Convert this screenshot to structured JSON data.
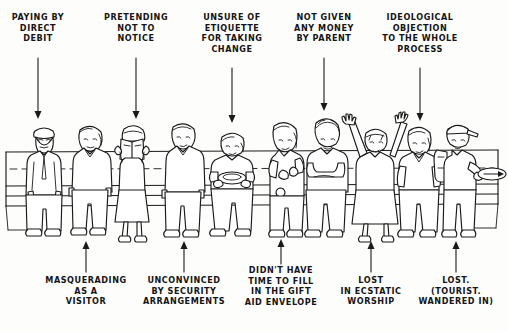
{
  "scene": {
    "title": "Church collection plate cartoon",
    "description": "A row of ten people standing and sitting at a church pew as the collection plate is passed, each annotated with a reason for not giving.",
    "ink_color": "#1a1a1a",
    "paper_color": "#fdfdfc"
  },
  "top_labels": [
    {
      "id": "paying-by-direct-debit",
      "text": "PAYING BY\nDIRECT\nDEBIT",
      "x": 38,
      "label_y": 12,
      "arrow_from": 52,
      "arrow_to": 112
    },
    {
      "id": "pretending-not-to-notice",
      "text": "PRETENDING\nNOT TO\nNOTICE",
      "x": 136,
      "label_y": 12,
      "arrow_from": 52,
      "arrow_to": 112
    },
    {
      "id": "unsure-of-etiquette",
      "text": "UNSURE OF\nETIQUETTE\nFOR TAKING\nCHANGE",
      "x": 232,
      "label_y": 12,
      "arrow_from": 62,
      "arrow_to": 120
    },
    {
      "id": "not-given-any-money",
      "text": "NOT GIVEN\nANY MONEY\nBY PARENT",
      "x": 324,
      "label_y": 12,
      "arrow_from": 52,
      "arrow_to": 110
    },
    {
      "id": "ideological-objection",
      "text": "IDEOLOGICAL\nOBJECTION\nTO THE WHOLE\nPROCESS",
      "x": 420,
      "label_y": 12,
      "arrow_from": 62,
      "arrow_to": 120
    }
  ],
  "bottom_labels": [
    {
      "id": "masquerading-as-a-visitor",
      "text": "MASQUERADING\nAS A\nVISITOR",
      "x": 86,
      "label_y": 275,
      "arrow_from": 270,
      "arrow_to": 240
    },
    {
      "id": "unconvinced-by-security",
      "text": "UNCONVINCED\nBY SECURITY\nARRANGEMENTS",
      "x": 184,
      "label_y": 275,
      "arrow_from": 270,
      "arrow_to": 240
    },
    {
      "id": "no-time-gift-aid-envelope",
      "text": "DIDN'T  HAVE\nTIME TO FILL\nIN THE GIFT\nAID ENVELOPE",
      "x": 281,
      "label_y": 265,
      "arrow_from": 262,
      "arrow_to": 238
    },
    {
      "id": "lost-in-ecstatic-worship",
      "text": "LOST\nIN ECSTATIC\nWORSHIP",
      "x": 371,
      "label_y": 275,
      "arrow_from": 270,
      "arrow_to": 240
    },
    {
      "id": "lost-tourist-wandered-in",
      "text": "LOST.\n(TOURIST.\nWANDERED IN)",
      "x": 456,
      "label_y": 275,
      "arrow_from": 270,
      "arrow_to": 240
    }
  ],
  "figures": [
    {
      "id": "man-with-tie-direct-debit",
      "name": "man in suit with glasses and tie",
      "x": 44
    },
    {
      "id": "woman-masquerading-visitor",
      "name": "woman in blouse and trousers",
      "x": 90
    },
    {
      "id": "woman-hymn-book",
      "name": "woman holding hymn book up to face",
      "x": 133
    },
    {
      "id": "man-unconvinced-security",
      "name": "man with arms at sides",
      "x": 182
    },
    {
      "id": "man-holding-plate",
      "name": "seated man holding collection plate",
      "x": 231
    },
    {
      "id": "woman-with-purse",
      "name": "woman holding purse and coins",
      "x": 283
    },
    {
      "id": "teenager-no-money",
      "name": "teenager with folded arms",
      "x": 325
    },
    {
      "id": "worshipper-arms-raised",
      "name": "worshipper with both arms raised",
      "x": 375
    },
    {
      "id": "seated-woman-gift-aid",
      "name": "woman seated on pew",
      "x": 417
    },
    {
      "id": "tourist-with-backpack",
      "name": "tourist with cap and backpack passing plate",
      "x": 463
    }
  ],
  "props": {
    "pew_back_rail": "horizontal pew back rail behind the figures",
    "pew_seat": "pew bench seat",
    "dashed_guide": "dashed horizontal guide line across the pew",
    "collection_plate": "collection plate being passed at the right with a direction arrow"
  }
}
